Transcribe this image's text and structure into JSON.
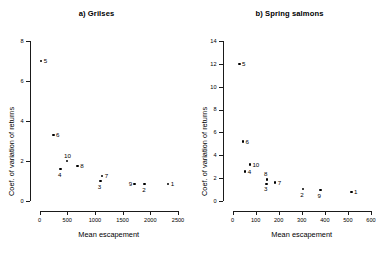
{
  "figure": {
    "axis_title_x": "Mean escapement",
    "axis_title_y": "Coef. of variation of returns"
  },
  "chart_data": [
    {
      "type": "scatter",
      "title": "a) Grilses",
      "xlabel": "Mean escapement",
      "ylabel": "Coef. of variation of returns",
      "xlim": [
        0,
        2500
      ],
      "ylim": [
        0,
        8
      ],
      "xticks": [
        0,
        500,
        1000,
        1500,
        2000,
        2500
      ],
      "yticks": [
        0,
        2,
        4,
        6,
        8
      ],
      "xtick_labels": [
        "0",
        "500",
        "1000",
        "1500",
        "2000",
        "2500"
      ],
      "ytick_labels": [
        "0",
        "2",
        "4",
        "6",
        "8"
      ],
      "grid": false,
      "legend": "none",
      "points": [
        {
          "label": "5",
          "x": 30,
          "y": 7.0,
          "label_pos": "right"
        },
        {
          "label": "6",
          "x": 250,
          "y": 3.3,
          "label_pos": "right"
        },
        {
          "label": "10",
          "x": 500,
          "y": 2.0,
          "label_pos": "above"
        },
        {
          "label": "8",
          "x": 690,
          "y": 1.75,
          "label_pos": "right"
        },
        {
          "label": "4",
          "x": 380,
          "y": 1.6,
          "label_pos": "below"
        },
        {
          "label": "7",
          "x": 1130,
          "y": 1.25,
          "label_pos": "right"
        },
        {
          "label": "3",
          "x": 1100,
          "y": 1.0,
          "label_pos": "below"
        },
        {
          "label": "9",
          "x": 1720,
          "y": 0.85,
          "label_pos": "left"
        },
        {
          "label": "2",
          "x": 1900,
          "y": 0.85,
          "label_pos": "below"
        },
        {
          "label": "1",
          "x": 2320,
          "y": 0.85,
          "label_pos": "right"
        }
      ]
    },
    {
      "type": "scatter",
      "title": "b) Spring salmons",
      "xlabel": "Mean escapement",
      "ylabel": "Coef. of variation of returns",
      "xlim": [
        0,
        600
      ],
      "ylim": [
        0,
        14
      ],
      "xticks": [
        0,
        100,
        200,
        300,
        400,
        500,
        600
      ],
      "yticks": [
        0,
        2,
        4,
        6,
        8,
        10,
        12,
        14
      ],
      "xtick_labels": [
        "0",
        "100",
        "200",
        "300",
        "400",
        "500",
        "600"
      ],
      "ytick_labels": [
        "0",
        "2",
        "4",
        "6",
        "8",
        "10",
        "12",
        "14"
      ],
      "grid": false,
      "legend": "none",
      "points": [
        {
          "label": "5",
          "x": 30,
          "y": 12.0,
          "label_pos": "right"
        },
        {
          "label": "6",
          "x": 45,
          "y": 5.2,
          "label_pos": "right"
        },
        {
          "label": "10",
          "x": 75,
          "y": 3.2,
          "label_pos": "right"
        },
        {
          "label": "4",
          "x": 55,
          "y": 2.6,
          "label_pos": "right"
        },
        {
          "label": "8",
          "x": 150,
          "y": 1.9,
          "label_pos": "above"
        },
        {
          "label": "7",
          "x": 185,
          "y": 1.6,
          "label_pos": "right"
        },
        {
          "label": "3",
          "x": 148,
          "y": 1.5,
          "label_pos": "below"
        },
        {
          "label": "2",
          "x": 305,
          "y": 1.05,
          "label_pos": "below"
        },
        {
          "label": "9",
          "x": 380,
          "y": 0.95,
          "label_pos": "below"
        },
        {
          "label": "1",
          "x": 515,
          "y": 0.8,
          "label_pos": "right"
        }
      ]
    }
  ]
}
